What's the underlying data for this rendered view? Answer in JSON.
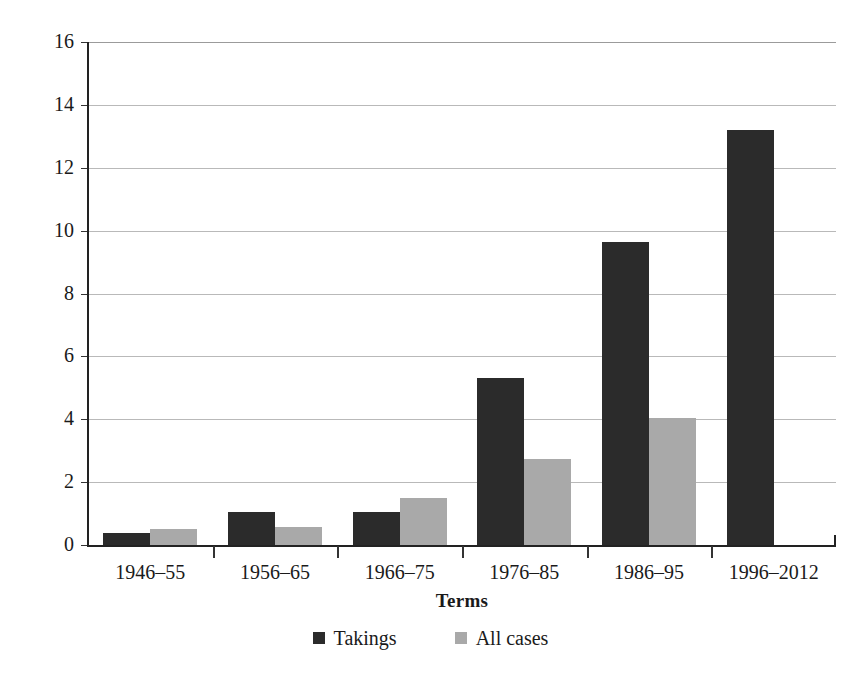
{
  "chart_data": {
    "type": "bar",
    "title": "",
    "subtitle": "",
    "xlabel": "Terms",
    "ylabel": "Mean # per case",
    "categories": [
      "1946–55",
      "1956–65",
      "1966–75",
      "1976–85",
      "1986–95",
      "1996–2012"
    ],
    "series": [
      {
        "name": "Takings",
        "color": "#2b2b2b",
        "values": [
          0.38,
          1.05,
          1.05,
          5.3,
          9.65,
          13.2
        ]
      },
      {
        "name": "All cases",
        "color": "#a9a9a9",
        "values": [
          0.5,
          0.57,
          1.5,
          2.75,
          4.05,
          null
        ]
      }
    ],
    "ylim": [
      0,
      16
    ],
    "yticks": [
      0,
      2,
      4,
      6,
      8,
      10,
      12,
      14,
      16
    ],
    "ytick_labels": [
      "0",
      "2",
      "4",
      "6",
      "8",
      "10",
      "12",
      "14",
      "16"
    ],
    "grid": true,
    "grid_axis": "y",
    "legend_position": "bottom-center",
    "bar_layout": "grouped-adjacent"
  },
  "axes": {
    "y_title": "Mean # per case",
    "x_title": "Terms"
  },
  "legend": {
    "entries": [
      {
        "label": "Takings",
        "swatch": "takings"
      },
      {
        "label": "All cases",
        "swatch": "allcases"
      }
    ]
  }
}
